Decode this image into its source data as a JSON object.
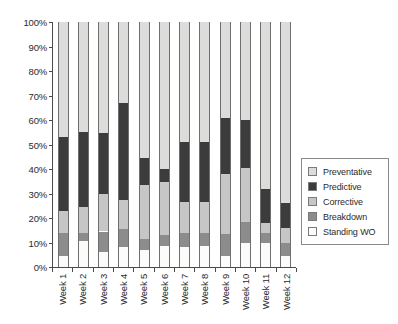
{
  "chart_data": {
    "type": "bar",
    "stacked": true,
    "title": "",
    "subtitle": "",
    "xlabel": "",
    "ylabel": "",
    "grid": false,
    "legend_position": "right",
    "ylim": [
      0,
      100
    ],
    "ytick_labels": [
      "100%",
      "90%",
      "80%",
      "70%",
      "60%",
      "50%",
      "40%",
      "30%",
      "20%",
      "10%",
      "0%"
    ],
    "ytick_values": [
      100,
      90,
      80,
      70,
      60,
      50,
      40,
      30,
      20,
      10,
      0
    ],
    "categories": [
      "Week 1",
      "Week 2",
      "Week 3",
      "Week 4",
      "Week 5",
      "Week 6",
      "Week 7",
      "Week 8",
      "Week 9",
      "Week 10",
      "Week 11",
      "Week 12"
    ],
    "stack_order_bottom_to_top": [
      "Standing WO",
      "Breakdown",
      "Corrective",
      "Predictive",
      "Preventative"
    ],
    "series": [
      {
        "name": "Standing WO",
        "color": "#fbfbf9",
        "values": [
          4.5,
          10.5,
          6.0,
          8.0,
          7.0,
          8.5,
          8.0,
          8.5,
          4.5,
          10.0,
          10.0,
          4.5
        ]
      },
      {
        "name": "Breakdown",
        "color": "#8c8c8c",
        "values": [
          9.5,
          3.5,
          8.5,
          7.5,
          4.5,
          4.5,
          6.0,
          5.5,
          9.0,
          8.5,
          4.0,
          5.5
        ]
      },
      {
        "name": "Corrective",
        "color": "#c6c6c6",
        "values": [
          9.0,
          10.5,
          15.5,
          12.0,
          22.0,
          21.5,
          12.5,
          12.5,
          24.5,
          22.0,
          4.0,
          6.0
        ]
      },
      {
        "name": "Predictive",
        "color": "#3c3c3c",
        "values": [
          30.0,
          30.5,
          24.5,
          39.5,
          11.0,
          5.5,
          24.5,
          24.5,
          23.0,
          19.5,
          14.0,
          10.0
        ]
      },
      {
        "name": "Preventative",
        "color": "#dcdcda",
        "values": [
          47.0,
          45.0,
          45.5,
          33.0,
          55.5,
          60.0,
          49.0,
          49.0,
          39.0,
          40.0,
          68.0,
          74.0
        ]
      }
    ]
  },
  "legend": {
    "items": [
      {
        "label": "Preventative",
        "color": "#dcdcda"
      },
      {
        "label": "Predictive",
        "color": "#3c3c3c"
      },
      {
        "label": "Corrective",
        "color": "#c6c6c6"
      },
      {
        "label": "Breakdown",
        "color": "#8c8c8c"
      },
      {
        "label": "Standing WO",
        "color": "#fbfbf9"
      }
    ]
  },
  "axis": {
    "y_labels": [
      "100%",
      "90%",
      "80%",
      "70%",
      "60%",
      "50%",
      "40%",
      "30%",
      "20%",
      "10%",
      "0%"
    ],
    "x_labels": [
      "Week 1",
      "Week 2",
      "Week 3",
      "Week 4",
      "Week 5",
      "Week 6",
      "Week 7",
      "Week 8",
      "Week 9",
      "Week 10",
      "Week 11",
      "Week 12"
    ]
  }
}
